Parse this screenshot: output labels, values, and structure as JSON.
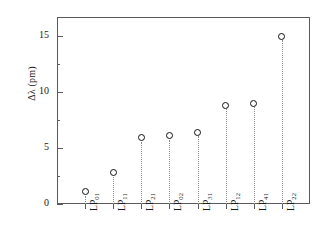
{
  "chart_data": {
    "type": "scatter",
    "title": "",
    "xlabel": "",
    "ylabel": "Δλ (pm)",
    "categories": [
      "LP01",
      "LP11",
      "LP21",
      "LP02",
      "LP31",
      "LP12",
      "LP41",
      "LP22"
    ],
    "category_labels": [
      {
        "base": "LP",
        "sub": "01"
      },
      {
        "base": "LP",
        "sub": "11"
      },
      {
        "base": "LP",
        "sub": "21"
      },
      {
        "base": "LP",
        "sub": "02"
      },
      {
        "base": "LP",
        "sub": "31"
      },
      {
        "base": "LP",
        "sub": "12"
      },
      {
        "base": "LP",
        "sub": "41"
      },
      {
        "base": "LP",
        "sub": "22"
      }
    ],
    "values": [
      1.1,
      2.8,
      5.9,
      6.1,
      6.4,
      8.8,
      9.0,
      15.0
    ],
    "ylim": [
      0,
      16.5
    ],
    "yticks": [
      0,
      5,
      10,
      15
    ],
    "ytick_labels": [
      "0",
      "5",
      "10",
      "15"
    ],
    "yticks_minor": [
      2.5,
      7.5,
      12.5
    ],
    "grid": false,
    "legend": null,
    "marker_style": "open-circle",
    "stem_style": "dotted",
    "colors": {
      "marker_edge": "#111111",
      "marker_face": "#ffffff",
      "stem": "#8d8d8d",
      "axis": "#5a5a5a",
      "text": "#1a1a1a",
      "background": "#ffffff"
    }
  }
}
